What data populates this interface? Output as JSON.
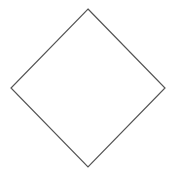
{
  "diagram": {
    "shape": "diamond",
    "label": "",
    "stroke_color": "#555555",
    "fill_color": "#ffffff",
    "stroke_width": 1.2,
    "vertices": {
      "top": [
        88,
        9
      ],
      "right": [
        165,
        88
      ],
      "bottom": [
        88,
        167
      ],
      "left": [
        11,
        88
      ]
    }
  }
}
